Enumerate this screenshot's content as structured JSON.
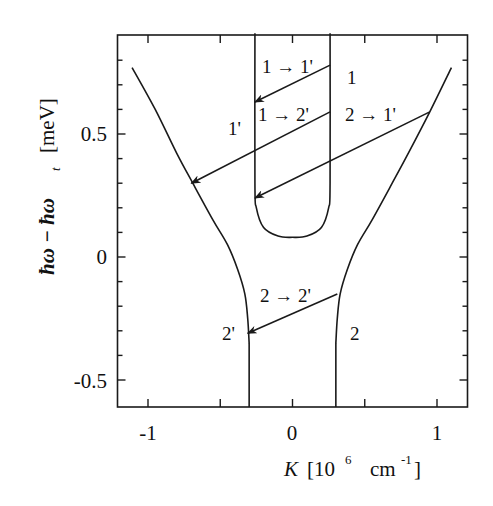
{
  "chart_data": {
    "type": "line",
    "title": "",
    "xlabel": "K [10^6 cm^-1]",
    "ylabel": "ħω − ħω_t [meV]",
    "xlim": [
      -1.21,
      1.21
    ],
    "ylim": [
      -0.61,
      0.91
    ],
    "grid": false,
    "x_ticks": [
      -1,
      0,
      1
    ],
    "x_minor_ticks": [
      -0.5,
      0.5
    ],
    "y_ticks": [
      -0.5,
      0,
      0.5
    ],
    "y_minor_ticks": [
      -0.4,
      -0.3,
      -0.2,
      -0.1,
      0.1,
      0.2,
      0.3,
      0.4,
      0.6,
      0.7,
      0.8
    ],
    "series": [
      {
        "name": "1'",
        "description": "upper outer branch (left)",
        "points": [
          [
            -1.11,
            0.77
          ],
          [
            -0.95,
            0.6
          ],
          [
            -0.8,
            0.42
          ],
          [
            -0.69,
            0.3
          ],
          [
            -0.55,
            0.15
          ],
          [
            -0.45,
            0.05
          ],
          [
            -0.38,
            -0.05
          ],
          [
            -0.33,
            -0.15
          ],
          [
            -0.31,
            -0.25
          ],
          [
            -0.3,
            -0.35
          ]
        ]
      },
      {
        "name": "1",
        "description": "upper outer branch (right)",
        "points": [
          [
            1.1,
            0.77
          ],
          [
            0.95,
            0.59
          ],
          [
            0.8,
            0.42
          ],
          [
            0.69,
            0.3
          ],
          [
            0.55,
            0.15
          ],
          [
            0.45,
            0.05
          ],
          [
            0.38,
            -0.05
          ],
          [
            0.33,
            -0.15
          ],
          [
            0.31,
            -0.25
          ],
          [
            0.3,
            -0.35
          ]
        ]
      },
      {
        "name": "U-branch",
        "description": "inner U-shaped branch",
        "points": [
          [
            -0.26,
            0.91
          ],
          [
            -0.26,
            0.3
          ],
          [
            -0.25,
            0.2
          ],
          [
            -0.2,
            0.12
          ],
          [
            -0.1,
            0.085
          ],
          [
            0,
            0.08
          ],
          [
            0.1,
            0.085
          ],
          [
            0.2,
            0.12
          ],
          [
            0.25,
            0.2
          ],
          [
            0.26,
            0.3
          ],
          [
            0.26,
            0.91
          ]
        ]
      },
      {
        "name": "2'",
        "description": "lower branch (left)",
        "points": [
          [
            -0.3,
            -0.35
          ],
          [
            -0.3,
            -0.61
          ]
        ]
      },
      {
        "name": "2",
        "description": "lower branch (right)",
        "points": [
          [
            0.3,
            -0.35
          ],
          [
            0.3,
            -0.61
          ]
        ]
      }
    ],
    "arrows": [
      {
        "label": "1 → 1'",
        "from": [
          0.26,
          0.78
        ],
        "to": [
          -0.26,
          0.63
        ]
      },
      {
        "label": "1 → 2'",
        "from": [
          0.26,
          0.59
        ],
        "to": [
          -0.7,
          0.3
        ]
      },
      {
        "label": "2 → 1'",
        "from": [
          0.95,
          0.59
        ],
        "to": [
          -0.26,
          0.24
        ]
      },
      {
        "label": "2 → 2'",
        "from": [
          0.31,
          -0.15
        ],
        "to": [
          -0.31,
          -0.31
        ]
      }
    ],
    "annotations": [
      {
        "text": "1",
        "x": 0.41,
        "y": 0.73
      },
      {
        "text": "1'",
        "x": -0.37,
        "y": 0.52
      },
      {
        "text": "2'",
        "x": -0.42,
        "y": -0.31
      },
      {
        "text": "2",
        "x": 0.43,
        "y": -0.31
      }
    ]
  },
  "labels": {
    "x_ticks": [
      "-1",
      "0",
      "1"
    ],
    "y_ticks": [
      "0.5",
      "0",
      "-0.5"
    ],
    "xlabel_main": "K",
    "xlabel_unit_open": "[10",
    "xlabel_exp": "6",
    "xlabel_unit_mid": "cm",
    "xlabel_exp2": "-1",
    "xlabel_unit_close": "]",
    "ylabel": "ħω − ħω",
    "ylabel_sub": "t",
    "ylabel_unit": "[meV]",
    "arrow_1_1p": "1 → 1'",
    "arrow_1_2p": "1 → 2'",
    "arrow_2_1p": "2 → 1'",
    "arrow_2_2p": "2 → 2'",
    "branch_1": "1",
    "branch_1p": "1'",
    "branch_2": "2",
    "branch_2p": "2'"
  }
}
